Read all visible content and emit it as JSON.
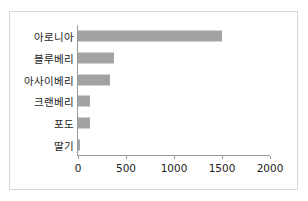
{
  "figure": {
    "top_partial_text": "",
    "background_color": "#ffffff",
    "frame_border_color": "#d8d8d8",
    "bar_color": "#a3a3a3",
    "axis_color": "#9a9a9a",
    "text_color": "#1c1c1c"
  },
  "chart_data": {
    "type": "bar",
    "orientation": "horizontal",
    "title": "",
    "xlabel": "",
    "ylabel": "",
    "categories": [
      "아로니아",
      "블루베리",
      "아사이베리",
      "크랜베리",
      "포도",
      "딸기"
    ],
    "values": [
      1500,
      380,
      330,
      130,
      130,
      20
    ],
    "xlim": [
      0,
      2000
    ],
    "ylim": null,
    "xticks": [
      0,
      500,
      1000,
      1500,
      2000
    ],
    "xtick_labels": [
      "0",
      "500",
      "1000",
      "1500",
      "2000"
    ],
    "grid": false,
    "legend": null,
    "series": [
      {
        "name": "",
        "values": [
          1500,
          380,
          330,
          130,
          130,
          20
        ]
      }
    ]
  }
}
